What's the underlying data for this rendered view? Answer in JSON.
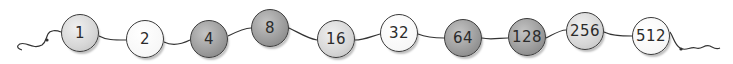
{
  "diagram": {
    "beads": [
      {
        "label": "1",
        "shade": "light",
        "x": 61,
        "y": 18
      },
      {
        "label": "2",
        "shade": "white",
        "x": 126,
        "y": 26
      },
      {
        "label": "4",
        "shade": "dark",
        "x": 190,
        "y": 20
      },
      {
        "label": "8",
        "shade": "dark",
        "x": 251,
        "y": 9
      },
      {
        "label": "16",
        "shade": "light",
        "x": 317,
        "y": 20
      },
      {
        "label": "32",
        "shade": "white",
        "x": 380,
        "y": 14
      },
      {
        "label": "64",
        "shade": "dark",
        "x": 444,
        "y": 18
      },
      {
        "label": "128",
        "shade": "dark",
        "x": 508,
        "y": 18
      },
      {
        "label": "256",
        "shade": "light",
        "x": 566,
        "y": 12
      },
      {
        "label": "512",
        "shade": "white",
        "x": 632,
        "y": 18
      }
    ],
    "colors": {
      "outline": "#3a3a3a",
      "light": "#d6d6d6",
      "white": "#f7f7f7",
      "dark": "#9a9a9a",
      "text": "#2b2b2b"
    }
  }
}
